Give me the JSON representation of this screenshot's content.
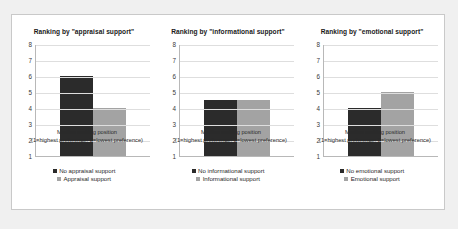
{
  "figure": {
    "background_color": "#f0f0f0",
    "panel_color": "#ffffff",
    "border_color": "#c9c9c9"
  },
  "chart_data": [
    {
      "type": "bar",
      "title": "Ranking by \"appraisal support\"",
      "xlabel_line1": "Median ranking position",
      "xlabel_line2": "(1=highest preference; 8=lowest preference)",
      "ylabel": "",
      "categories": [
        "No appraisal support",
        "Appraisal support"
      ],
      "values": [
        6,
        4
      ],
      "colors": [
        "#2b2b2b",
        "#a3a3a3"
      ],
      "ylim": [
        1,
        8
      ],
      "yticks": [
        8,
        7,
        6,
        5,
        4,
        3,
        2,
        1
      ],
      "grid": true,
      "legend_position": "bottom",
      "legend": [
        {
          "label": "No appraisal support",
          "color": "#2b2b2b"
        },
        {
          "label": "Appraisal support",
          "color": "#a3a3a3"
        }
      ]
    },
    {
      "type": "bar",
      "title": "Ranking by \"informational support\"",
      "xlabel_line1": "Median ranking position",
      "xlabel_line2": "(1=highest preference; 8=lowest preference)",
      "ylabel": "",
      "categories": [
        "No informational support",
        "Informational support"
      ],
      "values": [
        4.5,
        4.5
      ],
      "colors": [
        "#2b2b2b",
        "#a3a3a3"
      ],
      "ylim": [
        1,
        8
      ],
      "yticks": [
        8,
        7,
        6,
        5,
        4,
        3,
        2,
        1
      ],
      "grid": true,
      "legend_position": "bottom",
      "legend": [
        {
          "label": "No informational support",
          "color": "#2b2b2b"
        },
        {
          "label": "Informational support",
          "color": "#a3a3a3"
        }
      ]
    },
    {
      "type": "bar",
      "title": "Ranking by \"emotional support\"",
      "xlabel_line1": "Median ranking position",
      "xlabel_line2": "(1=highest preference; 8=lowest preference)",
      "ylabel": "",
      "categories": [
        "No emotional support",
        "Emotional support"
      ],
      "values": [
        4,
        5
      ],
      "colors": [
        "#2b2b2b",
        "#a3a3a3"
      ],
      "ylim": [
        1,
        8
      ],
      "yticks": [
        8,
        7,
        6,
        5,
        4,
        3,
        2,
        1
      ],
      "grid": true,
      "legend_position": "bottom",
      "legend": [
        {
          "label": "No emotional support",
          "color": "#2b2b2b"
        },
        {
          "label": "Emotional support",
          "color": "#a3a3a3"
        }
      ]
    }
  ]
}
